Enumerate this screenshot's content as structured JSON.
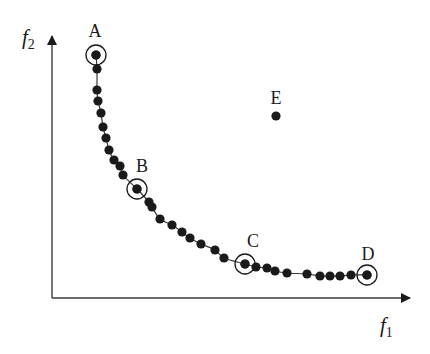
{
  "diagram": {
    "type": "pareto-front",
    "axes": {
      "x_label": "f",
      "x_subscript": "1",
      "y_label": "f",
      "y_subscript": "2"
    },
    "labeled_points": [
      {
        "id": "A",
        "label": "A",
        "x": 96,
        "y": 55,
        "circled": true,
        "lx": 95,
        "ly": 37
      },
      {
        "id": "B",
        "label": "B",
        "x": 137,
        "y": 189,
        "circled": true,
        "lx": 142,
        "ly": 172
      },
      {
        "id": "C",
        "label": "C",
        "x": 245,
        "y": 264,
        "circled": true,
        "lx": 253,
        "ly": 247
      },
      {
        "id": "D",
        "label": "D",
        "x": 367,
        "y": 275,
        "circled": true,
        "lx": 368,
        "ly": 260
      },
      {
        "id": "E",
        "label": "E",
        "x": 276,
        "y": 116,
        "circled": false,
        "lx": 276,
        "ly": 104
      }
    ],
    "front_points": [
      [
        96,
        55
      ],
      [
        97,
        69
      ],
      [
        97,
        90
      ],
      [
        98,
        101
      ],
      [
        101,
        113
      ],
      [
        103,
        127
      ],
      [
        106,
        138
      ],
      [
        109,
        150
      ],
      [
        114,
        160
      ],
      [
        120,
        166
      ],
      [
        123,
        175
      ],
      [
        137,
        189
      ],
      [
        149,
        202
      ],
      [
        152,
        207
      ],
      [
        160,
        219
      ],
      [
        172,
        225
      ],
      [
        182,
        232
      ],
      [
        190,
        238
      ],
      [
        201,
        244
      ],
      [
        215,
        250
      ],
      [
        224,
        258
      ],
      [
        245,
        264
      ],
      [
        256,
        267
      ],
      [
        267,
        268
      ],
      [
        275,
        271
      ],
      [
        287,
        273
      ],
      [
        307,
        274
      ],
      [
        320,
        276
      ],
      [
        330,
        276
      ],
      [
        340,
        276
      ],
      [
        351,
        275
      ],
      [
        367,
        275
      ]
    ],
    "colors": {
      "ink": "#1a1a1a",
      "axis": "#3a3a3a",
      "background": "#ffffff"
    }
  }
}
